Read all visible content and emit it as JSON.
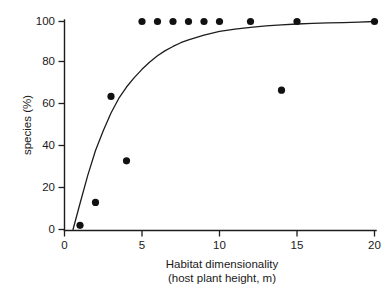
{
  "chart_data": {
    "type": "scatter",
    "title": "",
    "xlabel": "Habitat dimensionality",
    "xlabel_line2": "(host plant height, m)",
    "ylabel": "Frequency of macropterous",
    "ylabel_line2": "species (%)",
    "xlim": [
      0,
      20
    ],
    "ylim": [
      0,
      100
    ],
    "xticks": [
      0,
      5,
      10,
      15,
      20
    ],
    "xticklabels": [
      "0",
      "5",
      "10",
      "15",
      "20"
    ],
    "yticks": [
      0,
      20,
      40,
      60,
      80,
      100
    ],
    "yticklabels": [
      "0",
      "20",
      "40",
      "60",
      "80",
      "100"
    ],
    "grid": false,
    "legend": "none",
    "marker": "filled-circle",
    "marker_color": "#111111",
    "axis_color": "#1d1d1d",
    "points": [
      {
        "x": 1,
        "y": 2
      },
      {
        "x": 2,
        "y": 13
      },
      {
        "x": 3,
        "y": 64
      },
      {
        "x": 4,
        "y": 33
      },
      {
        "x": 5,
        "y": 100
      },
      {
        "x": 6,
        "y": 100
      },
      {
        "x": 7,
        "y": 100
      },
      {
        "x": 8,
        "y": 100
      },
      {
        "x": 9,
        "y": 100
      },
      {
        "x": 10,
        "y": 100
      },
      {
        "x": 12,
        "y": 100
      },
      {
        "x": 14,
        "y": 67
      },
      {
        "x": 15,
        "y": 100
      },
      {
        "x": 20,
        "y": 100
      }
    ],
    "fit_curve": {
      "description": "saturating asymptotic curve",
      "x": [
        0.55,
        1,
        1.5,
        2,
        2.5,
        3,
        3.5,
        4,
        4.5,
        5,
        5.5,
        6,
        6.5,
        7,
        7.5,
        8,
        9,
        10,
        11,
        12,
        13,
        14,
        15,
        16,
        17,
        18,
        19,
        20
      ],
      "y": [
        0,
        12.5,
        26,
        38,
        47.5,
        56,
        63,
        68.5,
        73,
        77,
        80.5,
        83.5,
        86,
        88,
        89.8,
        91.2,
        93.5,
        95.2,
        96.3,
        97.2,
        97.9,
        98.4,
        98.8,
        99.1,
        99.3,
        99.5,
        99.7,
        100
      ]
    }
  },
  "axes": {
    "x_title_line1": "Habitat dimensionality",
    "x_title_line2": "(host plant height, m)",
    "y_title_line1": "Frequency of macropterous",
    "y_title_line2": "species (%)"
  }
}
